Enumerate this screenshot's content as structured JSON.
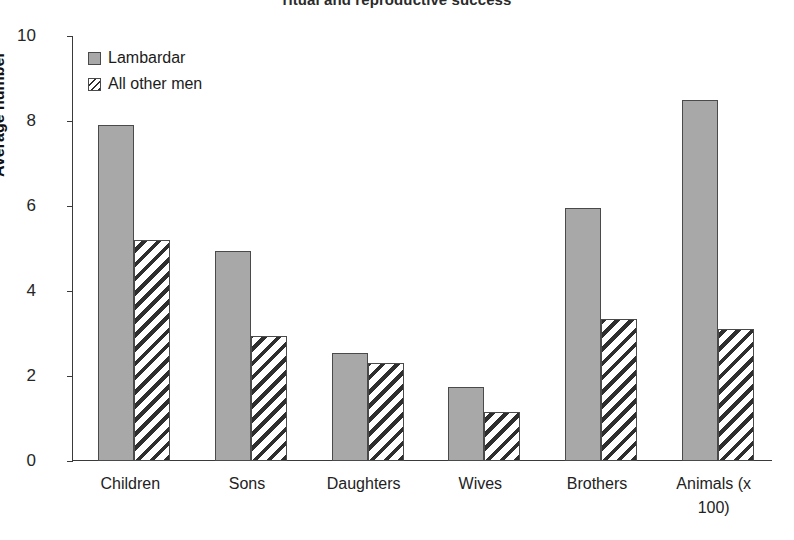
{
  "chart_data": {
    "type": "bar",
    "title": "ritual and reproductive success",
    "xlabel": "",
    "ylabel": "Average number",
    "ylim": [
      0,
      10
    ],
    "yticks": [
      0,
      2,
      4,
      6,
      8,
      10
    ],
    "grid": false,
    "legend_position": "top-left",
    "categories": [
      "Children",
      "Sons",
      "Daughters",
      "Wives",
      "Brothers",
      "Animals (x 100)"
    ],
    "series": [
      {
        "name": "Lambardar",
        "fill": "solid-gray",
        "color": "#a8a8a8",
        "values": [
          7.9,
          4.95,
          2.55,
          1.75,
          5.95,
          8.5
        ]
      },
      {
        "name": "All other men",
        "fill": "diagonal-hatch",
        "color": "#ffffff",
        "values": [
          5.2,
          2.95,
          2.3,
          1.15,
          3.35,
          3.1
        ]
      }
    ]
  },
  "axis": {
    "y_title": "Average number",
    "tick_labels": [
      "10",
      "8",
      "6",
      "4",
      "2",
      "0"
    ]
  },
  "legend": {
    "entries": [
      {
        "label": "Lambardar"
      },
      {
        "label": "All other men"
      }
    ]
  },
  "category_labels": [
    {
      "line1": "Children",
      "line2": ""
    },
    {
      "line1": "Sons",
      "line2": ""
    },
    {
      "line1": "Daughters",
      "line2": ""
    },
    {
      "line1": "Wives",
      "line2": ""
    },
    {
      "line1": "Brothers",
      "line2": ""
    },
    {
      "line1": "Animals (x",
      "line2": "100)"
    }
  ],
  "colors": {
    "series_solid": "#a8a8a8",
    "hatch_stroke": "#2e2e2e",
    "axis": "#3a3a3a",
    "text": "#1a1a1a",
    "background": "#ffffff"
  }
}
